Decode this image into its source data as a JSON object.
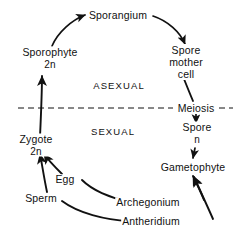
{
  "diagram": {
    "background_color": "#ffffff",
    "ink_color": "#111111",
    "divider": {
      "style": "dashed",
      "label": "Meiosis"
    },
    "regions": [
      {
        "id": "asexual",
        "label": "ASEXUAL",
        "x": 119,
        "y": 85
      },
      {
        "id": "sexual",
        "label": "SEXUAL",
        "x": 113,
        "y": 131
      }
    ],
    "nodes": [
      {
        "id": "sporangium",
        "label": "Sporangium",
        "x": 118,
        "y": 16
      },
      {
        "id": "sporophyte",
        "label": "Sporophyte",
        "ploidy": "2n",
        "x": 50,
        "y": 58
      },
      {
        "id": "spore-mother-cell",
        "label": "Spore mother cell",
        "x": 186,
        "y": 62
      },
      {
        "id": "meiosis",
        "label": "Meiosis",
        "x": 196,
        "y": 108
      },
      {
        "id": "spore",
        "label": "Spore",
        "ploidy": "n",
        "x": 197,
        "y": 133
      },
      {
        "id": "gametophyte",
        "label": "Gametophyte",
        "x": 193,
        "y": 168
      },
      {
        "id": "zygote",
        "label": "Zygote",
        "ploidy": "2n",
        "x": 36,
        "y": 145
      },
      {
        "id": "egg",
        "label": "Egg",
        "x": 65,
        "y": 180
      },
      {
        "id": "sperm",
        "label": "Sperm",
        "x": 41,
        "y": 199
      },
      {
        "id": "archegonium",
        "label": "Archegonium",
        "x": 148,
        "y": 203
      },
      {
        "id": "antheridium",
        "label": "Antheridium",
        "x": 151,
        "y": 222
      }
    ]
  }
}
